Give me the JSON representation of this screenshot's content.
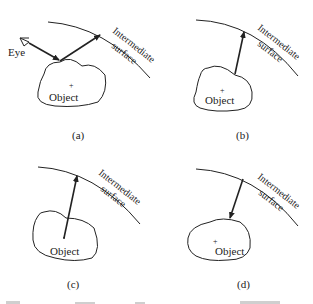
{
  "figure": {
    "panels": [
      {
        "id": "a",
        "caption": "(a)",
        "object_label": "Object",
        "surface_label_1": "Intermediate",
        "surface_label_2": "surface",
        "eye_label": "Eye"
      },
      {
        "id": "b",
        "caption": "(b)",
        "object_label": "Object",
        "surface_label_1": "Intermediate",
        "surface_label_2": "surface"
      },
      {
        "id": "c",
        "caption": "(c)",
        "object_label": "Object",
        "surface_label_1": "Intermediate",
        "surface_label_2": "surface"
      },
      {
        "id": "d",
        "caption": "(d)",
        "object_label": "Object",
        "surface_label_1": "Intermediate",
        "surface_label_2": "surface"
      }
    ],
    "colors": {
      "stroke": "#222222",
      "background": "#ffffff"
    }
  }
}
